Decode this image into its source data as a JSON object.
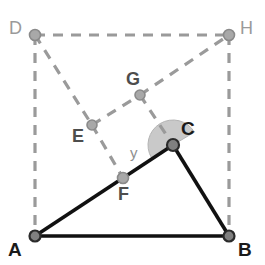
{
  "figure": {
    "background_color": "#ffffff",
    "canvas": {
      "width": 265,
      "height": 265
    }
  },
  "style": {
    "solid_line_color": "#111111",
    "solid_line_width": 3.6,
    "dashed_line_color": "#9a9a9a",
    "dashed_line_width": 3.2,
    "dash_pattern": "10 8",
    "node_fill_dark": "#808080",
    "node_fill_light": "#a8a8a8",
    "node_stroke_dark": "#2b2b2b",
    "node_stroke_light": "#8a8a8a",
    "angle_wedge_fill": "#c9c9c9",
    "angle_wedge_stroke": "#b4b4b4"
  },
  "points": [
    {
      "id": "A",
      "label": "A",
      "x": 35,
      "y": 236,
      "label_x": 8,
      "label_y": 240,
      "label_class": "label-dark",
      "node_r": 5.5,
      "node_kind": "dark"
    },
    {
      "id": "B",
      "label": "B",
      "x": 229,
      "y": 236,
      "label_x": 238,
      "label_y": 240,
      "label_class": "label-dark",
      "node_r": 5.5,
      "node_kind": "dark"
    },
    {
      "id": "C",
      "label": "C",
      "x": 173,
      "y": 145,
      "label_x": 181,
      "label_y": 119,
      "label_class": "label-dark",
      "node_r": 6.0,
      "node_kind": "dark"
    },
    {
      "id": "D",
      "label": "D",
      "x": 35,
      "y": 35,
      "label_x": 9,
      "label_y": 19,
      "label_class": "label-light",
      "node_r": 5.5,
      "node_kind": "light"
    },
    {
      "id": "H",
      "label": "H",
      "x": 229,
      "y": 35,
      "label_x": 240,
      "label_y": 19,
      "label_class": "label-light",
      "node_r": 5.5,
      "node_kind": "light"
    },
    {
      "id": "E",
      "label": "E",
      "x": 92,
      "y": 125,
      "label_x": 72,
      "label_y": 127,
      "label_class": "label-mid",
      "node_r": 5.0,
      "node_kind": "light"
    },
    {
      "id": "F",
      "label": "F",
      "x": 123,
      "y": 178,
      "label_x": 118,
      "label_y": 185,
      "label_class": "label-mid",
      "node_r": 5.5,
      "node_kind": "light"
    },
    {
      "id": "G",
      "label": "G",
      "x": 140,
      "y": 95,
      "label_x": 126,
      "label_y": 70,
      "label_class": "label-mid",
      "node_r": 5.0,
      "node_kind": "light"
    }
  ],
  "solid_edges": [
    {
      "id": "AB",
      "from": "A",
      "to": "B",
      "name": "segment-ab"
    },
    {
      "id": "AC",
      "from": "A",
      "to": "C",
      "name": "segment-ac"
    },
    {
      "id": "CB",
      "from": "C",
      "to": "B",
      "name": "segment-cb"
    }
  ],
  "dashed_edges": [
    {
      "id": "DH",
      "from": "D",
      "to": "H",
      "name": "segment-dh"
    },
    {
      "id": "DA",
      "from": "D",
      "to": "A",
      "name": "segment-da"
    },
    {
      "id": "HB",
      "from": "H",
      "to": "B",
      "name": "segment-hb"
    },
    {
      "id": "DE",
      "from": "D",
      "to": "E",
      "name": "segment-de"
    },
    {
      "id": "EF",
      "from": "E",
      "to": "F",
      "name": "segment-ef"
    },
    {
      "id": "EG",
      "from": "E",
      "to": "G",
      "name": "segment-eg"
    },
    {
      "id": "GH",
      "from": "G",
      "to": "H",
      "name": "segment-gh"
    },
    {
      "id": "GC",
      "from": "G",
      "to": "C",
      "name": "segment-gc"
    }
  ],
  "angle": {
    "id": "y",
    "label": "y",
    "at_point": "C",
    "label_x": 130,
    "label_y": 145,
    "radius": 25,
    "start_deg": 149,
    "end_deg": 329
  }
}
